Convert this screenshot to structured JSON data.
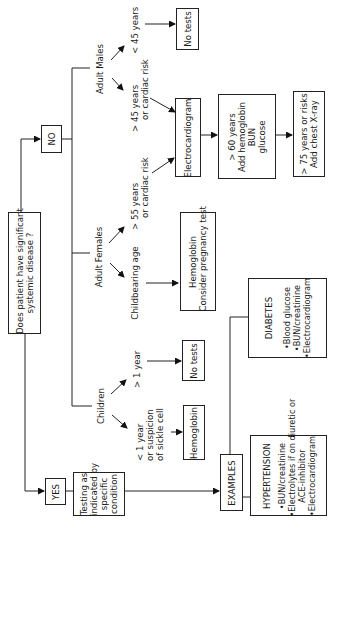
{
  "diagram": {
    "orientation": "rotated-90-ccw",
    "question": {
      "lines": [
        "Does patient have significant",
        "systemic disease ?"
      ]
    },
    "yes": {
      "label": "YES"
    },
    "no": {
      "label": "NO"
    },
    "testing": {
      "lines": [
        "Testing as",
        "indicated by",
        "specific",
        "condition"
      ]
    },
    "examples": {
      "label": "EXAMPLES"
    },
    "hypertension": {
      "title": "HYPERTENSION",
      "items": [
        "•BUN/creatinine",
        "•Electrolytes if on diuretic or",
        "ACE-inhibitor",
        "•Electrocardiogram"
      ]
    },
    "diabetes": {
      "title": "DIABETES",
      "items": [
        "•Blood glucose",
        "•BUN/creatinine",
        "•Electrocardiogram"
      ]
    },
    "children": {
      "label": "Children",
      "under1": {
        "lines": [
          "<  1 year",
          "or suspicion",
          "of sickle cell"
        ]
      },
      "over1": {
        "label": ">  1 year"
      },
      "hemoglobin_box": "Hemoglobin",
      "no_tests_box": "No tests"
    },
    "adult_females": {
      "label": "Adult Females",
      "childbearing": "Childbearing age",
      "over55": {
        "lines": [
          ">  55 years",
          "or cardiac risk"
        ]
      },
      "hemoglobin_box": {
        "lines": [
          "Hemoglobin",
          "Consider pregnancy test"
        ]
      }
    },
    "adult_males": {
      "label": "Adult Males",
      "under45": "<  45 years",
      "over45": {
        "lines": [
          ">  45 years",
          "or cardiac risk"
        ]
      },
      "no_tests_box": "No tests"
    },
    "ecg_box": "Electrocardiogram",
    "over60_box": {
      "lines": [
        ">  60 years",
        "Add hemoglobin",
        "BUN",
        "glucose"
      ]
    },
    "over75_box": {
      "lines": [
        ">  75 years or risks",
        "Add chest X-ray"
      ]
    }
  }
}
